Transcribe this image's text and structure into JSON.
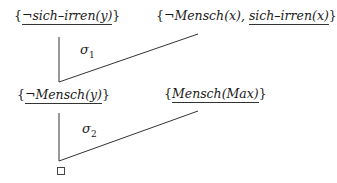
{
  "diagram": {
    "type": "resolution-tree",
    "line_color": "#333333",
    "step1": {
      "left_clause": {
        "open": "{",
        "literal": "¬sich–irren(y)",
        "close": "}",
        "underlined": "¬sich–irren(y)"
      },
      "right_clause": {
        "open": "{",
        "literal1": "¬Mensch(x),",
        "literal2": "sich–irren(x)",
        "close": "}",
        "underlined": "sich–irren(x)"
      },
      "substitution": {
        "symbol": "σ",
        "index": "1"
      }
    },
    "step2": {
      "left_clause": {
        "open": "{",
        "literal": "¬Mensch(y)",
        "close": "}",
        "underlined": "¬Mensch(y)"
      },
      "right_clause": {
        "open": "{",
        "literal": "Mensch(Max)",
        "close": "}",
        "underlined": "Mensch(Max)"
      },
      "substitution": {
        "symbol": "σ",
        "index": "2"
      }
    },
    "result": {
      "symbol": "□",
      "meaning": "empty-clause"
    }
  }
}
